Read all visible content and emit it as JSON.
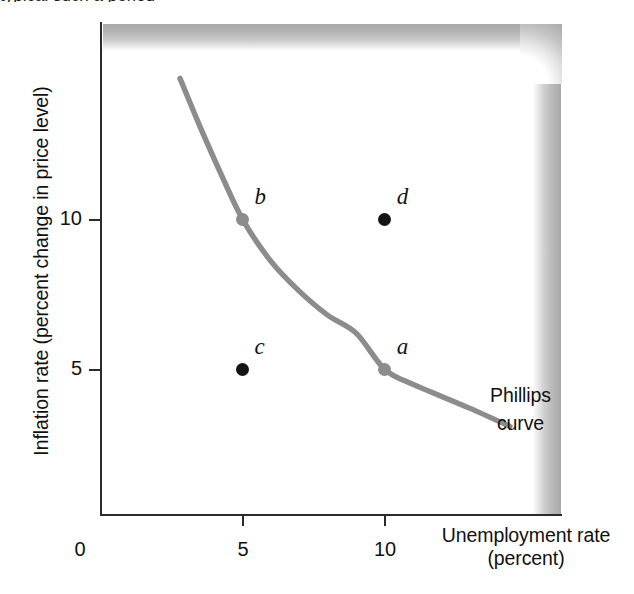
{
  "figure": {
    "top_clipped_text": "typical such a period",
    "curve_note_line1": "Phillips",
    "curve_note_line2": "curve"
  },
  "axes": {
    "y_title": "Inflation rate (percent change in price level)",
    "x_title_line1": "Unemployment rate",
    "x_title_line2": "(percent)",
    "y_ticks": [
      "5",
      "10"
    ],
    "x_ticks": [
      "0",
      "5",
      "10"
    ]
  },
  "points": [
    {
      "id": "a",
      "label": "a",
      "x": 10,
      "y": 5,
      "color": "#8c8c8c",
      "on_curve": true
    },
    {
      "id": "b",
      "label": "b",
      "x": 5,
      "y": 10,
      "color": "#8c8c8c",
      "on_curve": true
    },
    {
      "id": "c",
      "label": "c",
      "x": 5,
      "y": 5,
      "color": "#141414",
      "on_curve": false
    },
    {
      "id": "d",
      "label": "d",
      "x": 10,
      "y": 10,
      "color": "#141414",
      "on_curve": false
    }
  ],
  "colors": {
    "curve": "#8c8c8c",
    "axis": "#2b2b2b",
    "text": "#111111",
    "shadow": "#a9a9a9"
  },
  "chart_data": {
    "type": "line",
    "title": "",
    "xlabel": "Unemployment rate (percent)",
    "ylabel": "Inflation rate (percent change in price level)",
    "xlim": [
      0,
      15.8
    ],
    "ylim": [
      0,
      15.6
    ],
    "xticks": [
      0,
      5,
      10
    ],
    "yticks": [
      5,
      10
    ],
    "grid": false,
    "legend": null,
    "series": [
      {
        "name": "Phillips curve",
        "color": "#8c8c8c",
        "x": [
          2.8,
          3.5,
          4.2,
          5.0,
          6.0,
          7.0,
          8.0,
          9.0,
          10.0,
          11.0,
          12.0,
          13.0,
          14.4
        ],
        "y": [
          14.7,
          13.1,
          11.6,
          10.0,
          8.6,
          7.6,
          6.8,
          6.2,
          5.0,
          4.5,
          4.1,
          3.7,
          3.1
        ]
      }
    ],
    "annotations": [
      {
        "text": "a",
        "x": 10,
        "y": 5,
        "note": "point on Phillips curve"
      },
      {
        "text": "b",
        "x": 5,
        "y": 10,
        "note": "point on Phillips curve"
      },
      {
        "text": "c",
        "x": 5,
        "y": 5,
        "note": "point off curve (below)"
      },
      {
        "text": "d",
        "x": 10,
        "y": 10,
        "note": "point off curve (above)"
      },
      {
        "text": "Phillips curve",
        "x": 13.0,
        "y": 6.0,
        "note": "curve label"
      }
    ]
  }
}
